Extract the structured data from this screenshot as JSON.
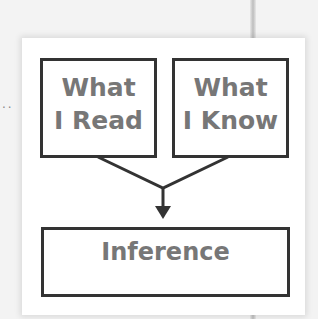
{
  "diagram": {
    "left_box": {
      "line1": "What",
      "line2": "I Read"
    },
    "right_box": {
      "line1": "What",
      "line2": "I Know"
    },
    "result_box": {
      "label": "Inference"
    },
    "margin_dots": "··"
  },
  "colors": {
    "border": "#333333",
    "text": "#777777",
    "card": "#ffffff",
    "background": "#f3f3f3"
  }
}
